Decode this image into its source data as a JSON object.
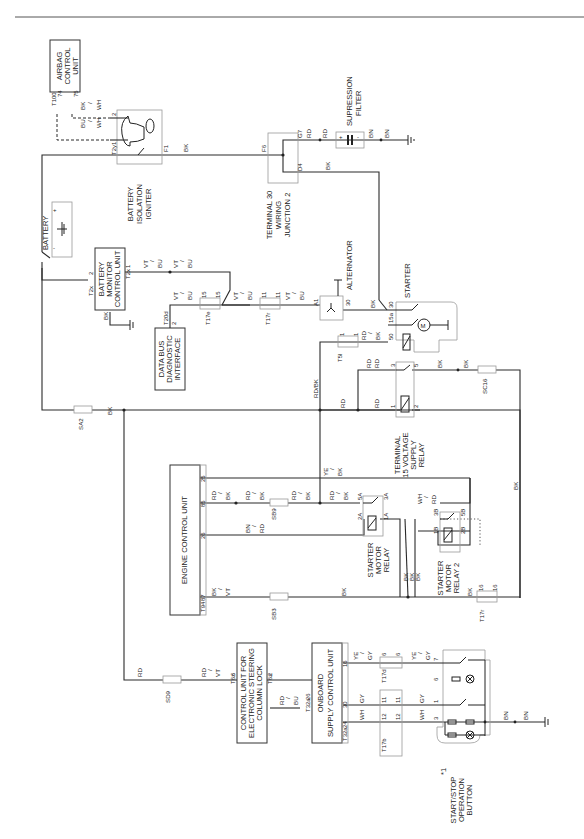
{
  "diagram": {
    "orientation": "rotated-90-ccw",
    "components": {
      "airbag_control_unit": {
        "label_lines": [
          "AIRBAG",
          "CONTROL",
          "UNIT"
        ],
        "connector": "T100",
        "pins": [
          "74",
          "75"
        ]
      },
      "battery_isolation_igniter": {
        "label_lines": [
          "BATTERY",
          "ISOLATION",
          "IGNITER"
        ],
        "connector": "T2y",
        "pins": [
          "1",
          "2"
        ],
        "terminal": "F1"
      },
      "terminal_30_wiring_junction_2": {
        "label_lines": [
          "TERMINAL 30",
          "WIRING",
          "JUNCTION 2"
        ],
        "pins": [
          "F6",
          "G7",
          "D4"
        ]
      },
      "supression_filter": {
        "label_lines": [
          "SUPRESSION",
          "FILTER"
        ],
        "plus": "+",
        "minus": "-"
      },
      "battery": {
        "label": "BATTERY",
        "plus": "+",
        "minus": "-"
      },
      "battery_monitor_control_unit": {
        "label_lines": [
          "BATTERY",
          "MONITOR",
          "CONTROL UNIT"
        ],
        "connector": "T2x",
        "pins": [
          "2",
          "1"
        ]
      },
      "data_bus_diagnostic_interface": {
        "label_lines": [
          "DATA BUS",
          "DIAGNOSTIC",
          "INTERFACE"
        ],
        "connector": "T20d",
        "pin": "2"
      },
      "alternator": {
        "label": "ALTERNATOR",
        "pins": [
          "A1",
          "30"
        ]
      },
      "starter": {
        "label": "STARTER",
        "pins": [
          "30",
          "15a",
          "50"
        ],
        "motor_glyph": "M"
      },
      "terminal_15_voltage_supply_relay": {
        "label_lines": [
          "TERMINAL",
          "15 VOLTAGE",
          "SUPPLY",
          "RELAY"
        ],
        "pins": [
          "1",
          "2",
          "3",
          "5"
        ]
      },
      "engine_control_unit": {
        "label": "ENGINE CONTROL UNIT",
        "connector": "T94",
        "pins": [
          "25",
          "85",
          "26",
          "87"
        ]
      },
      "starter_motor_relay": {
        "label_lines": [
          "STARTER",
          "MOTOR",
          "RELAY"
        ],
        "pins": [
          "5A",
          "3A",
          "2A",
          "1A"
        ]
      },
      "starter_motor_relay_2": {
        "label_lines": [
          "STARTER",
          "MOTOR",
          "RELAY 2"
        ],
        "pins": [
          "3B",
          "5B",
          "1B",
          "2B"
        ]
      },
      "control_unit_steering_lock": {
        "label_lines": [
          "CONTROL UNIT FOR",
          "ELECTRONIC STEERING",
          "COLUMN LOCK"
        ],
        "connectors": [
          "T6z",
          "T6z"
        ],
        "pins": [
          "6",
          "2"
        ]
      },
      "onboard_supply_control_unit": {
        "label_lines": [
          "ONBOARD",
          "SUPPLY CONTROL UNIT"
        ],
        "connector": "T32a",
        "pins": [
          "26",
          "16",
          "30",
          "24"
        ]
      },
      "start_stop_button": {
        "label_lines": [
          "START/STOP",
          "OPERATION",
          "BUTTON"
        ],
        "note": "*1",
        "pins": [
          "7",
          "6",
          "1",
          "3"
        ]
      }
    },
    "fuses": {
      "sa2": "SA2",
      "sb9": "SB9",
      "sb3": "SB3",
      "sd9": "SD9",
      "sc16": "SC16"
    },
    "connectors": {
      "t17e": {
        "label": "T17e",
        "pins": [
          "15",
          "15"
        ]
      },
      "t17r_a": {
        "label": "T17r",
        "pins": [
          "11",
          "11"
        ]
      },
      "t5i": {
        "label": "T5l",
        "pins": [
          "1",
          "1"
        ]
      },
      "t17r_b": {
        "label": "T17r",
        "pins": [
          "16",
          "16"
        ]
      },
      "t17d": {
        "label": "T17d",
        "pins": [
          "6",
          "6"
        ]
      },
      "t17x": {
        "pins": [
          "11",
          "11"
        ]
      },
      "t17b": {
        "label": "T17b",
        "pins": [
          "12",
          "12"
        ]
      }
    },
    "wire_colors": {
      "bk": "BK",
      "rd": "RD",
      "bn": "BN",
      "vt": "VT",
      "bu": "BU",
      "wh": "WH",
      "gy": "GY",
      "ye": "YE",
      "slash": "/",
      "rd_bk": "RD/BK"
    },
    "colors": {
      "line": "#2a2a2a",
      "ghost_outline": "#9a9a9a",
      "background": "#ffffff"
    }
  }
}
